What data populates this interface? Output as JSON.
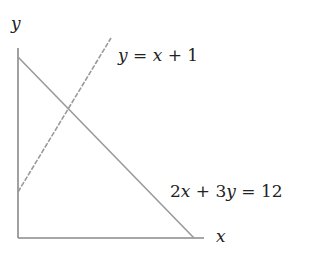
{
  "diagram": {
    "axes": {
      "x_label": "x",
      "y_label": "y",
      "color": "#8a8a8a"
    },
    "lines": [
      {
        "name": "line-2x-3y-12",
        "equation": "2x + 3y = 12",
        "style": "solid",
        "color": "#9a9a9a",
        "label_parts": {
          "a": "2",
          "v1": "x",
          "op1": " + ",
          "b": "3",
          "v2": "y",
          "eq": " = ",
          "c": "12"
        }
      },
      {
        "name": "line-y-x-plus-1",
        "equation": "y = x + 1",
        "style": "dashed",
        "color": "#9a9a9a",
        "label_parts": {
          "v1": "y",
          "eq": " = ",
          "v2": "x",
          "op": " + ",
          "c": "1"
        }
      }
    ]
  }
}
